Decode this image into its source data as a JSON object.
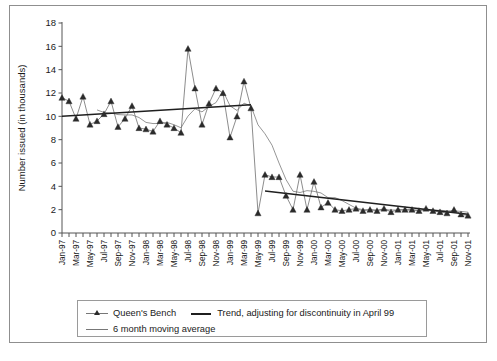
{
  "chart_data": {
    "type": "line",
    "title": "",
    "xlabel": "",
    "ylabel": "Number issued (in thousands)",
    "ylim": [
      0,
      18
    ],
    "yticks": [
      0,
      2,
      4,
      6,
      8,
      10,
      12,
      14,
      16,
      18
    ],
    "grid": false,
    "legend_position": "below-axes",
    "x": [
      "Jan-97",
      "Feb-97",
      "Mar-97",
      "Apr-97",
      "May-97",
      "Jun-97",
      "Jul-97",
      "Aug-97",
      "Sep-97",
      "Oct-97",
      "Nov-97",
      "Dec-97",
      "Jan-98",
      "Feb-98",
      "Mar-98",
      "Apr-98",
      "May-98",
      "Jun-98",
      "Jul-98",
      "Aug-98",
      "Sep-98",
      "Oct-98",
      "Nov-98",
      "Dec-98",
      "Jan-99",
      "Feb-99",
      "Mar-99",
      "Apr-99",
      "May-99",
      "Jun-99",
      "Jul-99",
      "Aug-99",
      "Sep-99",
      "Oct-99",
      "Nov-99",
      "Dec-99",
      "Jan-00",
      "Feb-00",
      "Mar-00",
      "Apr-00",
      "May-00",
      "Jun-00",
      "Jul-00",
      "Aug-00",
      "Sep-00",
      "Oct-00",
      "Nov-00",
      "Dec-00",
      "Jan-01",
      "Feb-01",
      "Mar-01",
      "Apr-01",
      "May-01",
      "Jun-01",
      "Jul-01",
      "Aug-01",
      "Sep-01",
      "Oct-01",
      "Nov-01"
    ],
    "xtick_labels": [
      "Jan-97",
      "Mar-97",
      "May-97",
      "Jul-97",
      "Sep-97",
      "Nov-97",
      "Jan-98",
      "Mar-98",
      "May-98",
      "Jul-98",
      "Sep-98",
      "Nov-98",
      "Jan-99",
      "Mar-99",
      "May-99",
      "Jul-99",
      "Sep-99",
      "Nov-99",
      "Jan-00",
      "Mar-00",
      "May-00",
      "Jul-00",
      "Sep-00",
      "Nov-00",
      "Jan-01",
      "Mar-01",
      "May-01",
      "Jul-01",
      "Sep-01",
      "Nov-01"
    ],
    "series": [
      {
        "name": "Queen's Bench",
        "marker": "triangle",
        "values": [
          11.6,
          11.3,
          9.8,
          11.7,
          9.3,
          9.6,
          10.2,
          11.3,
          9.1,
          9.8,
          10.9,
          9.0,
          8.9,
          8.7,
          9.6,
          9.3,
          9.0,
          8.6,
          15.8,
          12.4,
          9.3,
          11.1,
          12.4,
          12.0,
          8.2,
          10.0,
          13.0,
          10.7,
          1.7,
          5.0,
          4.8,
          4.8,
          3.2,
          2.0,
          5.0,
          2.0,
          4.4,
          2.2,
          2.6,
          2.0,
          1.9,
          2.0,
          2.1,
          1.9,
          2.0,
          1.9,
          2.1,
          1.8,
          2.0,
          2.0,
          2.0,
          1.9,
          2.1,
          1.9,
          1.8,
          1.7,
          2.0,
          1.6,
          1.5
        ]
      },
      {
        "name": "6 month moving average",
        "marker": "none",
        "values": [
          null,
          null,
          null,
          null,
          null,
          10.55,
          10.33,
          10.28,
          10.15,
          10.12,
          10.12,
          9.9,
          9.48,
          9.38,
          9.4,
          9.48,
          9.28,
          9.02,
          10.02,
          10.65,
          10.38,
          10.85,
          11.18,
          12.18,
          10.9,
          10.5,
          11.13,
          10.88,
          9.27,
          8.5,
          7.53,
          6.0,
          4.58,
          3.58,
          3.47,
          3.63,
          3.57,
          3.43,
          3.03,
          3.03,
          2.78,
          2.45,
          2.13,
          2.0,
          2.0,
          1.97,
          2.0,
          1.97,
          1.97,
          1.97,
          1.97,
          1.95,
          1.97,
          1.95,
          1.95,
          1.9,
          1.9,
          1.85,
          1.78
        ]
      },
      {
        "name": "Trend, adjusting for discontinuity in April 99",
        "marker": "none",
        "segments": [
          {
            "x_from": "Jan-97",
            "x_to": "Apr-99",
            "y_from": 10.0,
            "y_to": 11.0
          },
          {
            "x_from": "Jun-99",
            "x_to": "Nov-01",
            "y_from": 3.6,
            "y_to": 1.6
          }
        ]
      }
    ],
    "annotations": []
  },
  "legend": {
    "items": [
      {
        "label": "Queen's Bench",
        "style": "line-with-triangle-marker"
      },
      {
        "label": "Trend, adjusting for discontinuity in April 99",
        "style": "thick-dark-line"
      },
      {
        "label": "6 month moving average",
        "style": "thin-grey-line"
      }
    ]
  },
  "colors": {
    "series_main": "#6e6e6e",
    "series_moving_average": "#8a8a8a",
    "series_trend": "#1f1f1f",
    "marker": "#2b2b2b",
    "axis": "#555555",
    "frame": "#8f8f8f",
    "background": "#ffffff"
  }
}
